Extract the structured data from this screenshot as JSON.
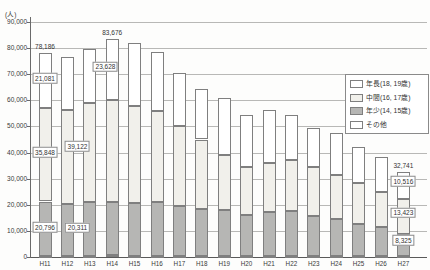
{
  "chart_data": {
    "type": "bar",
    "stacked": true,
    "unit_label": "(人)",
    "categories": [
      "H11",
      "H12",
      "H13",
      "H14",
      "H15",
      "H16",
      "H17",
      "H18",
      "H19",
      "H20",
      "H21",
      "H22",
      "H23",
      "H24",
      "H25",
      "H26",
      "H27"
    ],
    "series": [
      {
        "name": "年長(18, 19歳)",
        "color": "#ffffff",
        "values": [
          21081,
          20200,
          20600,
          23628,
          24000,
          22500,
          20500,
          19500,
          21900,
          19900,
          20600,
          17300,
          14900,
          16100,
          13800,
          13500,
          10516
        ]
      },
      {
        "name": "中間(16, 17歳)",
        "color": "#f1f0eb",
        "values": [
          35848,
          36000,
          37700,
          39122,
          37400,
          34800,
          30500,
          26700,
          21100,
          18500,
          18500,
          19600,
          18900,
          16800,
          15600,
          13600,
          13423
        ]
      },
      {
        "name": "年少(14, 15歳)",
        "color": "#b6b6b4",
        "values": [
          20796,
          19800,
          20700,
          20311,
          20100,
          20700,
          19000,
          17800,
          17500,
          15600,
          16900,
          17100,
          15200,
          14100,
          12100,
          10900,
          8325
        ]
      },
      {
        "name": "その他",
        "color": "#ffffff",
        "values": [
          461,
          500,
          500,
          615,
          500,
          500,
          500,
          500,
          500,
          500,
          500,
          500,
          500,
          500,
          500,
          500,
          477
        ]
      }
    ],
    "stack_order_bottom_to_top": [
      "その他",
      "年少(14, 15歳)",
      "中間(16, 17歳)",
      "年長(18, 19歳)"
    ],
    "totals": [
      78186,
      76500,
      79500,
      83676,
      82000,
      78500,
      70500,
      64500,
      61000,
      54500,
      56500,
      54500,
      49500,
      47500,
      42000,
      38500,
      32741
    ],
    "y_axis": {
      "min": 0,
      "max": 90000,
      "step": 10000,
      "tick_labels_top_to_bottom": [
        "90,000",
        "80,000",
        "70,000",
        "60,000",
        "50,000",
        "40,000",
        "30,000",
        "20,000",
        "10,000",
        "0"
      ]
    },
    "legend": {
      "position": "right",
      "labels": [
        "年長(18, 19歳)",
        "中間(16, 17歳)",
        "年少(14, 15歳)",
        "その他"
      ]
    },
    "grid": true,
    "annotations": [
      {
        "category": "H11",
        "kind": "total",
        "text": "78,186"
      },
      {
        "category": "H11",
        "kind": "box",
        "text": "21,081",
        "at_value": 68500,
        "dx": 0
      },
      {
        "category": "H11",
        "kind": "box",
        "text": "35,848",
        "at_value": 40200,
        "dx": 0
      },
      {
        "category": "H11",
        "kind": "box",
        "text": "20,796",
        "at_value": 11500,
        "dx": 0
      },
      {
        "category": "H14",
        "kind": "total",
        "text": "83,676"
      },
      {
        "category": "H14",
        "kind": "box",
        "text": "23,628",
        "at_value": 72800,
        "dx": -0.3
      },
      {
        "category": "H14",
        "kind": "box",
        "text": "39,122",
        "at_value": 42500,
        "dx": -1.55
      },
      {
        "category": "H14",
        "kind": "box",
        "text": "20,311",
        "at_value": 11300,
        "dx": -1.55
      },
      {
        "category": "H27",
        "kind": "total",
        "text": "32,741"
      },
      {
        "category": "H27",
        "kind": "box",
        "text": "10,516",
        "at_value": 29100,
        "dx": 0
      },
      {
        "category": "H27",
        "kind": "box",
        "text": "13,423",
        "at_value": 16900,
        "dx": 0
      },
      {
        "category": "H27",
        "kind": "box",
        "text": "8,325",
        "at_value": 6500,
        "dx": 0
      }
    ]
  }
}
